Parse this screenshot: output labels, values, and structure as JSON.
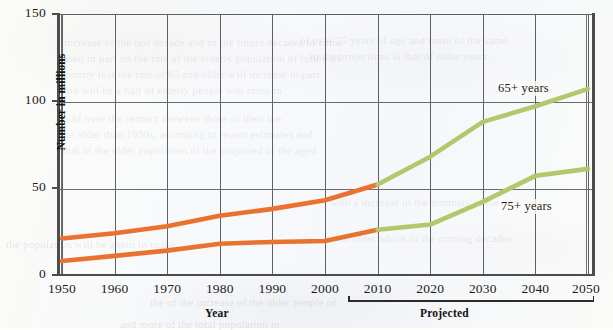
{
  "chart_data": {
    "type": "line",
    "title": "",
    "xlabel": "Year",
    "ylabel": "Number in millions",
    "xlim": [
      1950,
      2050
    ],
    "ylim": [
      0,
      150
    ],
    "grid": true,
    "legend_position": "inline-annotations",
    "x": [
      1950,
      1960,
      1970,
      1980,
      1990,
      2000,
      2010,
      2020,
      2030,
      2040,
      2050
    ],
    "xtick_labels": [
      "1950",
      "1960",
      "1970",
      "1980",
      "1990",
      "2000",
      "2010",
      "2020",
      "2030",
      "2040",
      "2050"
    ],
    "ytick_labels": [
      "0",
      "50",
      "100",
      "150"
    ],
    "ytick_values": [
      0,
      50,
      100,
      150
    ],
    "series": [
      {
        "name": "65+ years",
        "values": [
          21,
          24,
          28,
          34,
          38,
          43,
          52,
          68,
          88,
          97,
          107
        ],
        "historical_color": "#E8722E",
        "projected_color": "#B2C86C",
        "historical_through": 2010
      },
      {
        "name": "75+ years",
        "values": [
          8,
          11,
          14,
          18,
          19,
          19.5,
          26,
          29,
          42,
          57,
          61
        ],
        "historical_color": "#E8722E",
        "projected_color": "#B2C86C",
        "historical_through": 2010
      }
    ],
    "annotations": [
      {
        "text": "65+ years",
        "x": 2037,
        "y": 112
      },
      {
        "text": "75+ years",
        "x": 2038,
        "y": 44
      },
      {
        "text": "Projected",
        "x": 2030,
        "y": -22
      }
    ],
    "colors": {
      "historical": "#E8722E",
      "projected": "#B2C86C",
      "axis": "#4A4C50",
      "gridline": "#5F6165",
      "text": "#1B1B1B",
      "background": "#FAFAF8"
    }
  },
  "axis": {
    "ylabel": "Number in millions",
    "xlabel": "Year",
    "projected_label": "Projected",
    "yticks": [
      "150",
      "100",
      "50",
      "0"
    ],
    "xticks": [
      "1950",
      "1960",
      "1970",
      "1980",
      "1990",
      "2000",
      "2010",
      "2020",
      "2030",
      "2040",
      "2050"
    ]
  },
  "series_labels": {
    "upper": "65+ years",
    "lower": "75+ years"
  },
  "ghost_text": {
    "l1": "a increase of the last decade and of the future decades to come",
    "l2": "based in part on the rate of the elderly population of future of",
    "l3": "country that the rate of 65 and older will increase in part",
    "l4": "and will be a half of elderly people will cross in",
    "l5": "on of over the century between those of their the",
    "l6": "the older than 1990s, according to recent estimates and",
    "l7": "that of the older population of the projected of the aged",
    "l8": "of over 75 years of age and more of the same",
    "l9": "to the projections is that of older years",
    "l10": "the population will be about in to the",
    "l11": "the of the increase of the older people of",
    "l12": "and more of the total population in",
    "l13": "with a increase in the numbers of the",
    "l14": "of older adults in the coming decades"
  }
}
